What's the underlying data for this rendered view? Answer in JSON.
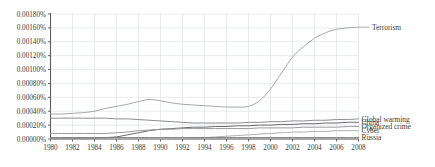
{
  "chart_data": {
    "type": "line",
    "title": "",
    "subtitle": "",
    "xlabel": "",
    "ylabel": "",
    "grid": true,
    "legend_position": "right-inline-labels",
    "xlim": [
      1980,
      2008
    ],
    "ylim": [
      0.0,
      0.0018
    ],
    "x_tick_labels": [
      "1980",
      "1982",
      "1984",
      "1986",
      "1988",
      "1990",
      "1992",
      "1994",
      "1996",
      "1998",
      "2000",
      "2002",
      "2004",
      "2006",
      "2008"
    ],
    "x_ticks": [
      1980,
      1982,
      1984,
      1986,
      1988,
      1990,
      1992,
      1994,
      1996,
      1998,
      2000,
      2002,
      2004,
      2006,
      2008
    ],
    "y_tick_labels": [
      "0.00000%",
      "0.00020%",
      "0.00040%",
      "0.00060%",
      "0.00080%",
      "0.00100%",
      "0.00120%",
      "0.00140%",
      "0.00160%",
      "0.00180%"
    ],
    "y_ticks": [
      0.0,
      0.0002,
      0.0004,
      0.0006,
      0.0008,
      0.001,
      0.0012,
      0.0014,
      0.0016,
      0.0018
    ],
    "x": [
      1980,
      1981,
      1982,
      1983,
      1984,
      1985,
      1986,
      1987,
      1988,
      1989,
      1990,
      1991,
      1992,
      1993,
      1994,
      1995,
      1996,
      1997,
      1998,
      1999,
      2000,
      2001,
      2002,
      2003,
      2004,
      2005,
      2006,
      2007,
      2008
    ],
    "series": [
      {
        "name": "Terrorism",
        "color": "#a8a8a8",
        "label_y_value": 0.00161,
        "values": [
          0.00036,
          0.00036,
          0.00037,
          0.00038,
          0.0004,
          0.00044,
          0.00047,
          0.0005,
          0.00054,
          0.00057,
          0.00055,
          0.00052,
          0.0005,
          0.00049,
          0.00048,
          0.00047,
          0.00046,
          0.00046,
          0.00047,
          0.00055,
          0.00072,
          0.00095,
          0.00118,
          0.00133,
          0.00145,
          0.00153,
          0.00158,
          0.0016,
          0.00161
        ]
      },
      {
        "name": "Global warming",
        "color": "#8d8d8d",
        "label_y_value": 0.00029,
        "values": [
          0.0003,
          0.0003,
          0.0003,
          0.0003,
          0.0003,
          0.0003,
          0.00029,
          0.00029,
          0.00028,
          0.00027,
          0.00026,
          0.00025,
          0.00024,
          0.00023,
          0.00023,
          0.00023,
          0.00023,
          0.00023,
          0.00024,
          0.00024,
          0.00025,
          0.00025,
          0.00026,
          0.00026,
          0.00027,
          0.00027,
          0.00028,
          0.00028,
          0.00029
        ]
      },
      {
        "name": "China",
        "color": "#6a6a6a",
        "label_y_value": 0.00024,
        "values": [
          1e-05,
          1e-05,
          1e-05,
          1e-05,
          1e-05,
          2e-05,
          3e-05,
          6e-05,
          9e-05,
          0.00012,
          0.00014,
          0.00015,
          0.00016,
          0.00017,
          0.00017,
          0.00018,
          0.00018,
          0.00019,
          0.00019,
          0.0002,
          0.0002,
          0.00021,
          0.00021,
          0.00022,
          0.00022,
          0.00023,
          0.00023,
          0.00024,
          0.00024
        ]
      },
      {
        "name": "Organized crime",
        "color": "#9a9a9a",
        "label_y_value": 0.00018,
        "values": [
          8e-05,
          8e-05,
          8e-05,
          8e-05,
          8e-05,
          8e-05,
          9e-05,
          0.0001,
          0.00012,
          0.00013,
          0.00014,
          0.00014,
          0.00015,
          0.00015,
          0.00015,
          0.00015,
          0.00015,
          0.00015,
          0.00015,
          0.00016,
          0.00016,
          0.00016,
          0.00016,
          0.00017,
          0.00017,
          0.00017,
          0.00017,
          0.00018,
          0.00018
        ]
      },
      {
        "name": "Cyber",
        "color": "#b0b0b0",
        "label_y_value": 0.00012,
        "values": [
          0.0,
          0.0,
          0.0,
          0.0,
          0.0,
          0.0,
          0.0,
          0.0,
          0.0,
          0.0,
          0.0,
          1e-05,
          1e-05,
          2e-05,
          2e-05,
          3e-05,
          4e-05,
          5e-05,
          6e-05,
          7e-05,
          8e-05,
          9e-05,
          0.0001,
          0.0001,
          0.00011,
          0.00011,
          0.00012,
          0.00012,
          0.00012
        ]
      },
      {
        "name": "Russia",
        "color": "#7d7d7d",
        "label_y_value": 2e-05,
        "values": [
          2e-05,
          2e-05,
          2e-05,
          2e-05,
          2e-05,
          2e-05,
          2e-05,
          2e-05,
          2e-05,
          2e-05,
          2e-05,
          2e-05,
          2e-05,
          2e-05,
          2e-05,
          2e-05,
          2e-05,
          2e-05,
          2e-05,
          2e-05,
          2e-05,
          2e-05,
          2e-05,
          2e-05,
          2e-05,
          2e-05,
          2e-05,
          2e-05,
          2e-05
        ]
      }
    ]
  },
  "colors": {
    "grid": "#d9dde4",
    "axis": "#5b5b5b",
    "text": "#3a3a3a",
    "background": "#ffffff"
  }
}
